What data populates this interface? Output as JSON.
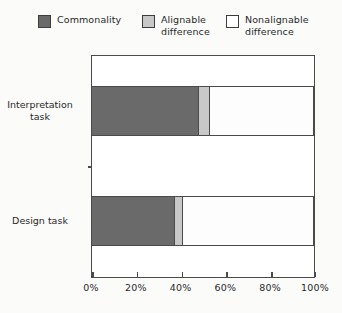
{
  "legend": {
    "items": [
      {
        "label": "Commonality",
        "swatch": "dark-gray-swatch-icon",
        "color": "#6a6a6a"
      },
      {
        "label": "Alignable\ndifference",
        "swatch": "light-gray-swatch-icon",
        "color": "#c8c8c8"
      },
      {
        "label": "Nonalignable\ndifference",
        "swatch": "white-swatch-icon",
        "color": "#ffffff"
      }
    ]
  },
  "axis": {
    "x_ticks": [
      "0%",
      "20%",
      "40%",
      "60%",
      "80%",
      "100%"
    ],
    "y_categories": [
      "Interpretation\ntask",
      "Design task"
    ]
  },
  "chart_data": {
    "type": "bar",
    "orientation": "horizontal",
    "stacked": true,
    "title": "",
    "xlabel": "",
    "ylabel": "",
    "xlim": [
      0,
      100
    ],
    "x_unit": "%",
    "grid": false,
    "legend_position": "top",
    "categories": [
      "Interpretation task",
      "Design task"
    ],
    "series": [
      {
        "name": "Commonality",
        "color": "#6a6a6a",
        "values": [
          48.7,
          38.0
        ]
      },
      {
        "name": "Alignable difference",
        "color": "#c8c8c8",
        "values": [
          5.0,
          3.6
        ]
      },
      {
        "name": "Nonalignable difference",
        "color": "#ffffff",
        "values": [
          46.3,
          58.4
        ]
      }
    ],
    "x_ticks": [
      0,
      20,
      40,
      60,
      80,
      100
    ],
    "x_tick_labels": [
      "0%",
      "20%",
      "40%",
      "60%",
      "80%",
      "100%"
    ]
  }
}
